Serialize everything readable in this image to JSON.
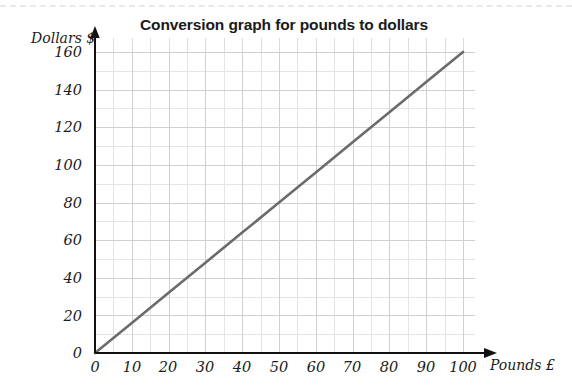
{
  "chart_data": {
    "type": "line",
    "title": "Conversion graph for pounds to dollars",
    "xlabel": "Pounds £",
    "ylabel": "Dollars $",
    "xlim": [
      0,
      100
    ],
    "ylim": [
      0,
      160
    ],
    "xticks": [
      0,
      10,
      20,
      30,
      40,
      50,
      60,
      70,
      80,
      90,
      100
    ],
    "yticks": [
      0,
      20,
      40,
      60,
      80,
      100,
      120,
      140,
      160
    ],
    "xtick_labels": [
      "0",
      "10",
      "20",
      "30",
      "40",
      "50",
      "60",
      "70",
      "80",
      "90",
      "100"
    ],
    "ytick_labels": [
      "0",
      "20",
      "40",
      "60",
      "80",
      "100",
      "120",
      "140",
      "160"
    ],
    "minor_x_step": 5,
    "minor_y_step": 10,
    "grid": true,
    "legend": "none",
    "series": [
      {
        "name": "pounds to dollars",
        "color": "#6b6b6b",
        "x": [
          0,
          10,
          20,
          30,
          40,
          50,
          60,
          70,
          80,
          90,
          100
        ],
        "values": [
          0,
          16,
          32,
          48,
          64,
          80,
          96,
          112,
          128,
          144,
          160
        ]
      }
    ],
    "annotations": []
  },
  "axis": {
    "x_arrow_icon": "arrow-right-icon",
    "y_arrow_icon": "arrow-up-icon"
  },
  "colors": {
    "line": "#6b6b6b",
    "axis": "#111111",
    "grid_minor": "#e4e4e8",
    "grid_major": "#cfcfd4",
    "text": "#1b1b1b",
    "title": "#1a1a1a",
    "top_rule": "#e9e9ea"
  }
}
